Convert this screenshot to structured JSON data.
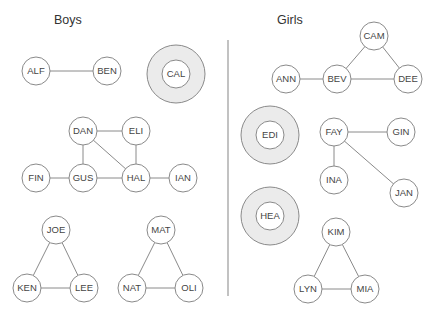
{
  "sections": {
    "boys": {
      "title": "Boys"
    },
    "girls": {
      "title": "Girls"
    }
  },
  "colors": {
    "stroke": "#8a8a8a",
    "node_fill": "#ffffff",
    "isolated_ring_fill": "#ebebeb",
    "label": "#444444",
    "divider": "#999999"
  },
  "divider": {
    "x": 228,
    "y1": 40,
    "y2": 296
  },
  "nodes": [
    {
      "id": "ALF",
      "group": "boys",
      "x": 36,
      "y": 71,
      "isolated": false
    },
    {
      "id": "BEN",
      "group": "boys",
      "x": 107,
      "y": 71,
      "isolated": false
    },
    {
      "id": "CAL",
      "group": "boys",
      "x": 176,
      "y": 74,
      "isolated": true
    },
    {
      "id": "DAN",
      "group": "boys",
      "x": 83,
      "y": 131,
      "isolated": false
    },
    {
      "id": "ELI",
      "group": "boys",
      "x": 136,
      "y": 131,
      "isolated": false
    },
    {
      "id": "FIN",
      "group": "boys",
      "x": 36,
      "y": 178,
      "isolated": false
    },
    {
      "id": "GUS",
      "group": "boys",
      "x": 83,
      "y": 178,
      "isolated": false
    },
    {
      "id": "HAL",
      "group": "boys",
      "x": 136,
      "y": 178,
      "isolated": false
    },
    {
      "id": "IAN",
      "group": "boys",
      "x": 183,
      "y": 178,
      "isolated": false
    },
    {
      "id": "JOE",
      "group": "boys",
      "x": 56,
      "y": 230,
      "isolated": false
    },
    {
      "id": "KEN",
      "group": "boys",
      "x": 27,
      "y": 288,
      "isolated": false
    },
    {
      "id": "LEE",
      "group": "boys",
      "x": 84,
      "y": 288,
      "isolated": false
    },
    {
      "id": "MAT",
      "group": "boys",
      "x": 161,
      "y": 230,
      "isolated": false
    },
    {
      "id": "NAT",
      "group": "boys",
      "x": 132,
      "y": 288,
      "isolated": false
    },
    {
      "id": "OLI",
      "group": "boys",
      "x": 189,
      "y": 288,
      "isolated": false
    },
    {
      "id": "CAM",
      "group": "girls",
      "x": 374,
      "y": 36,
      "isolated": false
    },
    {
      "id": "ANN",
      "group": "girls",
      "x": 286,
      "y": 79,
      "isolated": false
    },
    {
      "id": "BEV",
      "group": "girls",
      "x": 337,
      "y": 79,
      "isolated": false
    },
    {
      "id": "DEE",
      "group": "girls",
      "x": 408,
      "y": 79,
      "isolated": false
    },
    {
      "id": "EDI",
      "group": "girls",
      "x": 270,
      "y": 135,
      "isolated": true
    },
    {
      "id": "FAY",
      "group": "girls",
      "x": 334,
      "y": 132,
      "isolated": false
    },
    {
      "id": "GIN",
      "group": "girls",
      "x": 401,
      "y": 132,
      "isolated": false
    },
    {
      "id": "INA",
      "group": "girls",
      "x": 334,
      "y": 180,
      "isolated": false
    },
    {
      "id": "JAN",
      "group": "girls",
      "x": 404,
      "y": 193,
      "isolated": false
    },
    {
      "id": "HEA",
      "group": "girls",
      "x": 270,
      "y": 216,
      "isolated": true
    },
    {
      "id": "KIM",
      "group": "girls",
      "x": 336,
      "y": 232,
      "isolated": false
    },
    {
      "id": "LYN",
      "group": "girls",
      "x": 308,
      "y": 289,
      "isolated": false
    },
    {
      "id": "MIA",
      "group": "girls",
      "x": 365,
      "y": 289,
      "isolated": false
    }
  ],
  "edges": [
    [
      "ALF",
      "BEN"
    ],
    [
      "DAN",
      "ELI"
    ],
    [
      "DAN",
      "GUS"
    ],
    [
      "DAN",
      "HAL"
    ],
    [
      "ELI",
      "HAL"
    ],
    [
      "FIN",
      "GUS"
    ],
    [
      "GUS",
      "HAL"
    ],
    [
      "HAL",
      "IAN"
    ],
    [
      "JOE",
      "KEN"
    ],
    [
      "JOE",
      "LEE"
    ],
    [
      "KEN",
      "LEE"
    ],
    [
      "MAT",
      "NAT"
    ],
    [
      "MAT",
      "OLI"
    ],
    [
      "NAT",
      "OLI"
    ],
    [
      "ANN",
      "BEV"
    ],
    [
      "BEV",
      "CAM"
    ],
    [
      "BEV",
      "DEE"
    ],
    [
      "CAM",
      "DEE"
    ],
    [
      "FAY",
      "GIN"
    ],
    [
      "FAY",
      "INA"
    ],
    [
      "FAY",
      "JAN"
    ],
    [
      "KIM",
      "LYN"
    ],
    [
      "KIM",
      "MIA"
    ],
    [
      "LYN",
      "MIA"
    ]
  ],
  "sizes": {
    "node_r": 14,
    "ring_r": 29
  }
}
